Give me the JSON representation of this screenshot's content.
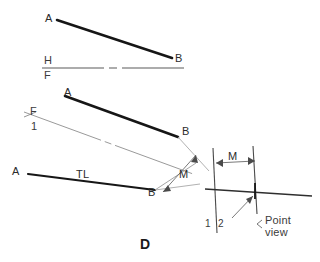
{
  "figure": {
    "id_label": "D",
    "background": "#ffffff",
    "object_line_color": "#161616",
    "thin_line_color": "#8a8a8a",
    "fold_line_color": "#5a5a5a",
    "text_color": "#3b3b3b",
    "width": 320,
    "height": 262
  },
  "views": {
    "top_view": {
      "name": "top-view",
      "point_a_label": "A",
      "point_b_label": "B"
    },
    "front_view": {
      "name": "front-view",
      "point_a_label": "A",
      "point_b_label": "B"
    },
    "auxiliary_view_1": {
      "name": "first-auxiliary-view",
      "point_a_label": "A",
      "point_b_label": "B",
      "true_length_label": "TL"
    },
    "auxiliary_view_2": {
      "name": "second-auxiliary-view",
      "point_view_label": "Point\nview"
    }
  },
  "fold_lines": {
    "hf": {
      "upper_label": "H",
      "lower_label": "F"
    },
    "f1": {
      "upper_label": "F",
      "lower_label": "1"
    },
    "one_two": {
      "left_label": "1",
      "right_label": "2"
    }
  },
  "dimensions": {
    "m_auxiliary": "M",
    "m_point_view": "M"
  }
}
